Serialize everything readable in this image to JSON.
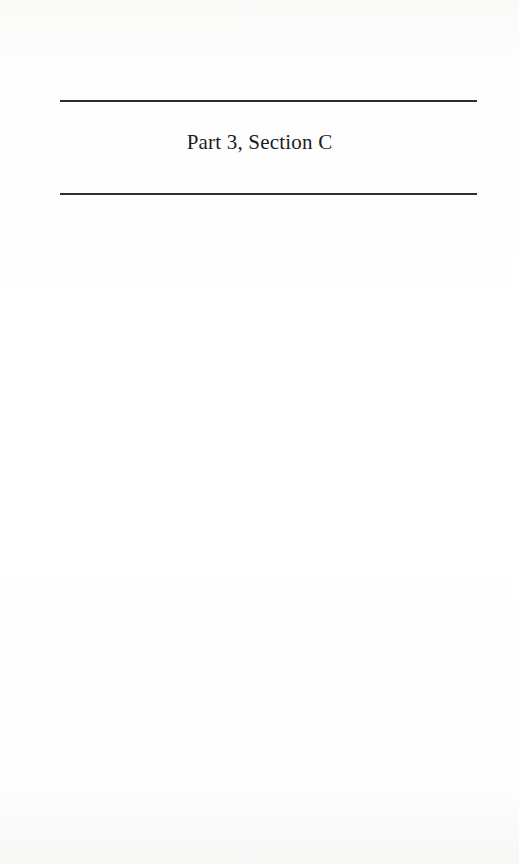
{
  "page": {
    "heading": "Part 3, Section C"
  },
  "colors": {
    "background": "#fdfdfc",
    "rule": "#2e2e2e",
    "text": "#1c1c1c"
  }
}
